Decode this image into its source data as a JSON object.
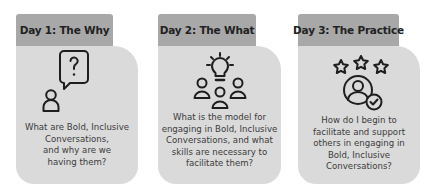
{
  "cards": [
    {
      "title": "Day 1: The Why",
      "icon": "person-question-speech-bubble-icon",
      "lines": [
        "What are Bold, Inclusive",
        "Conversations,",
        "and why are we",
        "having them?"
      ]
    },
    {
      "title": "Day 2: The What",
      "icon": "group-lightbulb-icon",
      "lines": [
        "What is the model for",
        "engaging in Bold, Inclusive",
        "Conversations, and what",
        "skills are necessary to",
        "facilitate them?"
      ]
    },
    {
      "title": "Day 3: The Practice",
      "icon": "user-stars-checkmark-icon",
      "lines": [
        "How do I begin to",
        "facilitate and support",
        "others in engaging in",
        "Bold, Inclusive",
        "Conversations?"
      ]
    }
  ],
  "colors": {
    "tab": "#a8a8a8",
    "card": "#dadada",
    "text": "#3a3a3a",
    "icon_stroke": "#1e1e1e"
  }
}
